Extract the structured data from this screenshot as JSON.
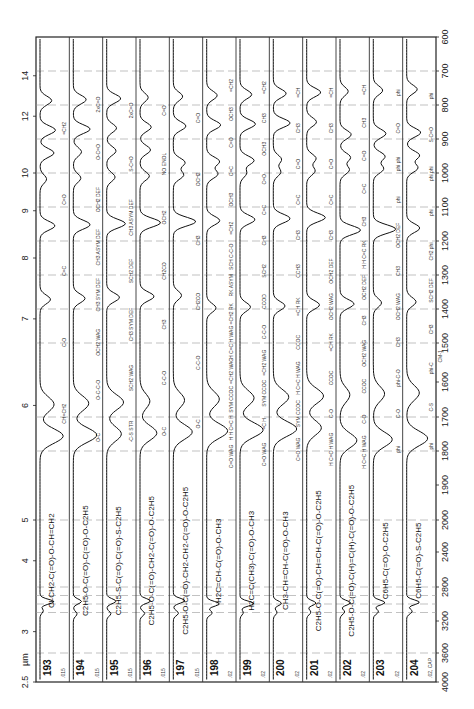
{
  "chart_data": {
    "type": "line",
    "orientation": "rotated-90-ccw",
    "x_axis_bottom": {
      "label": "CM-1",
      "ticks": [
        4000,
        3600,
        3200,
        2800,
        2400,
        2000,
        1900,
        1800,
        1700,
        1600,
        1500,
        1400,
        1300,
        1200,
        1100,
        1000,
        900,
        800,
        700,
        600
      ],
      "range": [
        4000,
        600
      ]
    },
    "x_axis_top": {
      "label": "µm",
      "ticks": [
        "2.5",
        "3",
        "4",
        "5",
        "6",
        "7",
        "8",
        "9",
        "10",
        "12",
        "14"
      ]
    },
    "y_label": "absorbance (per strip)",
    "grid": "dashed-vertical",
    "series": [
      {
        "name": "193",
        "formula": "Cl-CH2-C(=O)-O-CH=CH2",
        "path_length": ".015",
        "annotations": [
          "=CH2",
          "C=O",
          "C=C",
          "C-O",
          "CH=CH2"
        ]
      },
      {
        "name": "194",
        "formula": "C2H5-O-C(=O)-C(=O)-O-C2H5",
        "path_length": ".015",
        "annotations": [
          "2xC=O",
          "O-C=O",
          "OCH2 DEF",
          "CH3 ASYM DEF",
          "CH3 SYM DEF",
          "OCH2 WAG",
          "O-C-C-O",
          "O-C"
        ]
      },
      {
        "name": "195",
        "formula": "C2H5-S-C(=O)-C(=O)-S-C2H5",
        "path_length": ".015",
        "annotations": [
          "2xC=O",
          "S-C=O",
          "CH3 ASYM DEF",
          "SCH2 DEF",
          "CH3 SYM DEF",
          "SCH2 WAG",
          "-C-S STR"
        ]
      },
      {
        "name": "196",
        "formula": "C2H5-O-C(=O)-CH2-C(=O)-O-C2H5",
        "path_length": ".015",
        "annotations": [
          "C=O",
          "NO ENOL",
          "OCH2",
          "CH2CO",
          "CH3",
          "C-C-O",
          "O-C"
        ]
      },
      {
        "name": "197",
        "formula": "C2H5-O-C(=O)-CH2-CH2-C(=O)-O-C2H5",
        "path_length": ".015",
        "annotations": [
          "C=O",
          "OCH2",
          "CH3",
          "CH2CO",
          "C-C-O",
          "O-C"
        ]
      },
      {
        "name": "198",
        "formula": "H2C=CH-C(=O)-O-CH3",
        "path_length": ".02",
        "annotations": [
          "=CH2",
          "OCH3",
          "C=O",
          "C=C",
          "OCH3",
          "=CH2",
          "SCH C-C-O",
          "RK ASYM",
          "=CH2 RK",
          "H C=C H WAG",
          "=CH2 WAG",
          "SYM CCOC",
          "H H C=C H",
          "C=O WAG"
        ]
      },
      {
        "name": "199",
        "formula": "H2C=C(CH3)-C(=O)-O-CH3",
        "path_length": ".02",
        "annotations": [
          "=CH2",
          "CH3",
          "OCH3",
          "C=O",
          "C=C",
          "CH3",
          "SCH2",
          "CCOD",
          "C-C-O",
          "=CH2 WAG",
          "SYM CCOC",
          "=C H",
          "C=O WAG"
        ]
      },
      {
        "name": "200",
        "formula": "CH3-CH=CH-C(=O)-O-CH3",
        "path_length": ".02",
        "annotations": [
          "=CH",
          "CH3",
          "C=O",
          "C=C",
          "CH3",
          "CCH3",
          "=CH RK",
          "CCOC",
          "H C=C H WAG",
          "SYM CCOC",
          "C=O WAG"
        ]
      },
      {
        "name": "201",
        "formula": "C2H5-O-C(=O)-CH=CH-C(=O)-O-C2H5",
        "path_length": ".02",
        "annotations": [
          "=CH",
          "CH3",
          "C=O",
          "C=C",
          "CH3",
          "OCH2 DEF",
          "OCH2 WAG",
          "=CH RK",
          "CCOC",
          "C-O",
          "H C=C H WAG"
        ]
      },
      {
        "name": "202",
        "formula": "C2H5-O-C(=O)-C(H)=C(H)-C(=O)-O-C2H5",
        "path_length": ".02",
        "annotations": [
          "=CH",
          "CH3",
          "C=O",
          "C=C",
          "CH3",
          "H H C=C RK",
          "OCH2 DEF",
          "CH3",
          "OCH2 WAG",
          "CCOC",
          "C-O",
          "H C=C H WAG"
        ]
      },
      {
        "name": "203",
        "formula": "C6H5-C(=O)-O-C2H5",
        "path_length": ".02",
        "annotations": [
          "phi",
          "C=O",
          "phi phi",
          "phi",
          "OCH2 DEF",
          "CH3",
          "OCH2 WAG",
          "CH3",
          "phi-C-O",
          "C-O",
          "phi"
        ]
      },
      {
        "name": "204",
        "formula": "C6H5-C(=O)-S-C2H5",
        "path_length": ".02, CAP",
        "annotations": [
          "phi",
          "S-C=O",
          "phi phi",
          "phi",
          "CH2 phi",
          "SCH2 DEF",
          "CH3",
          "phi-C",
          "C-S",
          "phi"
        ]
      }
    ]
  },
  "axis": {
    "um_unit": "µm",
    "cm_unit": "CM-1"
  }
}
